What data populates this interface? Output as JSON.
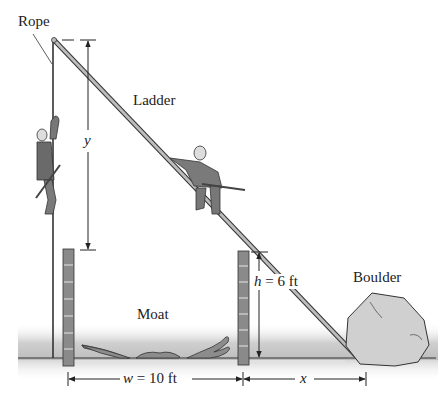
{
  "labels": {
    "rope": "Rope",
    "ladder": "Ladder",
    "moat": "Moat",
    "boulder": "Boulder",
    "y": "y",
    "h": "h = 6 ft",
    "w": "w = 10 ft",
    "x": "x"
  },
  "dimensions": {
    "h_value": "6 ft",
    "w_value": "10 ft"
  },
  "colors": {
    "line": "#222222",
    "ladder_fill": "#b8b8b8",
    "wall_fill": "#8a8a8a",
    "water": "#c8c8c8",
    "figure_fill": "#777777",
    "boulder_fill": "#cfcfcf"
  }
}
